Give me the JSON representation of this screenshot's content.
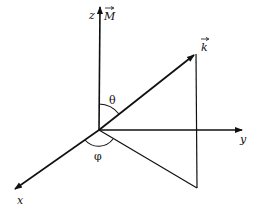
{
  "diagram": {
    "labels": {
      "z_axis": "z",
      "magnetization": "M",
      "wave_vector": "k",
      "y_axis": "y",
      "x_axis": "x",
      "polar_angle": "θ",
      "azimuthal_angle": "φ"
    },
    "colors": {
      "line": "#111111",
      "background": "#ffffff"
    },
    "geometry": {
      "origin": [
        99,
        130
      ],
      "z_tip": [
        100,
        5
      ],
      "y_tip": [
        243,
        130
      ],
      "x_tip": [
        13,
        190
      ],
      "k_tip": [
        196,
        53
      ],
      "k_projection_foot": [
        197,
        188
      ]
    }
  }
}
